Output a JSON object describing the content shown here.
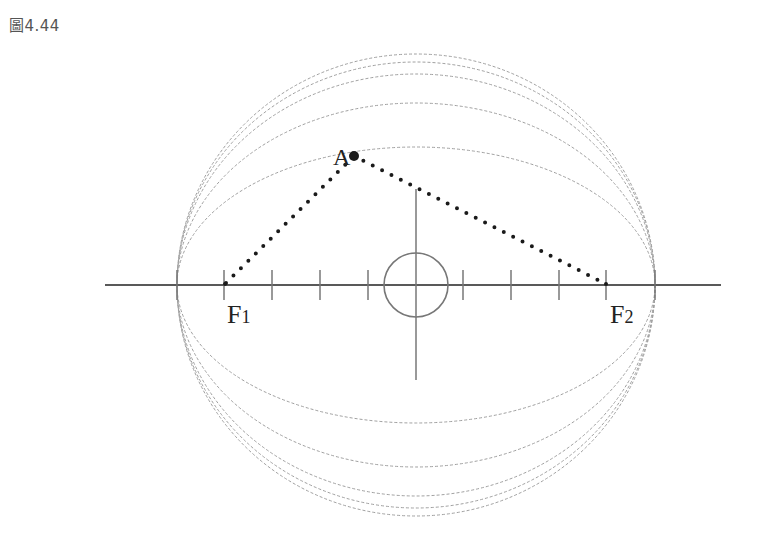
{
  "caption": "圖4.44",
  "labels": {
    "point_a": "A",
    "focus_1_main": "F",
    "focus_1_sub": "1",
    "focus_2_main": "F",
    "focus_2_sub": "2"
  },
  "geometry": {
    "axis_y": 285,
    "center_x": 416,
    "semi_major_axis": 239,
    "semi_minor_axes": [
      231,
      223,
      211,
      182,
      138
    ],
    "tick_spacing": 48,
    "focus_1_x": 224,
    "focus_2_x": 606,
    "point_a": [
      354,
      156
    ]
  },
  "colors": {
    "axis": "#222222",
    "ellipse": "#9a9a9a",
    "cross": "#777777",
    "dots": "#1a1a1a"
  }
}
